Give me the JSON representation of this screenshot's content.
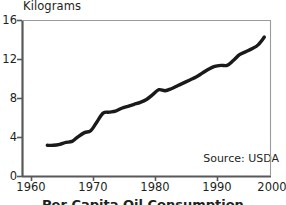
{
  "chart_data": {
    "type": "line",
    "title": "",
    "subtitle": "",
    "xlabel": "",
    "ylabel": "Kilograms",
    "y_axis_title": "Kilograms",
    "xlim": [
      1960,
      2000
    ],
    "ylim": [
      0,
      16
    ],
    "xticks": [
      1960,
      1970,
      1980,
      1990,
      2000
    ],
    "yticks": [
      0,
      4,
      8,
      12,
      16
    ],
    "xtick_labels": [
      "1960",
      "1970",
      "1980",
      "1990",
      "2000"
    ],
    "ytick_labels": [
      "0",
      "4",
      "8",
      "12",
      "16"
    ],
    "grid": false,
    "legend": false,
    "legend_position": "none",
    "line_color": "#1a1a1a",
    "axis_color": "#58595b",
    "annotations": [
      {
        "name": "source-note",
        "text": "Source: USDA",
        "x": 1997,
        "y": 1.6
      }
    ],
    "series": [
      {
        "name": "Consumption",
        "x": [
          1964,
          1965,
          1966,
          1967,
          1968,
          1969,
          1970,
          1971,
          1972,
          1973,
          1974,
          1975,
          1976,
          1977,
          1978,
          1979,
          1980,
          1981,
          1982,
          1983,
          1984,
          1985,
          1986,
          1987,
          1988,
          1989,
          1990,
          1991,
          1992,
          1993,
          1994,
          1995,
          1996,
          1997,
          1998,
          1999
        ],
        "values": [
          3.2,
          3.2,
          3.3,
          3.5,
          3.6,
          4.1,
          4.5,
          4.7,
          5.6,
          6.5,
          6.6,
          6.7,
          7.0,
          7.2,
          7.4,
          7.6,
          7.9,
          8.4,
          8.9,
          8.8,
          9.0,
          9.3,
          9.6,
          9.9,
          10.2,
          10.6,
          11.0,
          11.3,
          11.4,
          11.4,
          11.9,
          12.5,
          12.8,
          13.1,
          13.5,
          14.3
        ]
      }
    ]
  },
  "axes": {
    "y_title": "Kilograms",
    "x_labels": [
      "1960",
      "1970",
      "1980",
      "1990",
      "2000"
    ],
    "y_labels": [
      "16",
      "12",
      "8",
      "4",
      "0"
    ]
  },
  "notes": {
    "source": "Source: USDA"
  },
  "caption": {
    "text": "Per Capita Oil Consumption"
  }
}
